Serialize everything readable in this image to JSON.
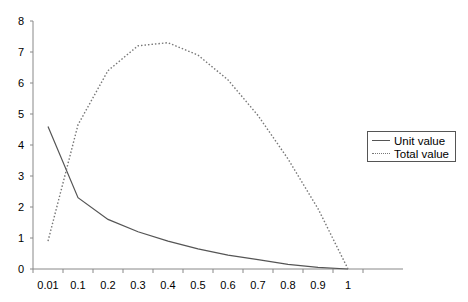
{
  "chart_data": {
    "type": "line",
    "title": "",
    "xlabel": "",
    "ylabel": "",
    "categories": [
      "0.01",
      "0.1",
      "0.2",
      "0.3",
      "0.4",
      "0.5",
      "0.6",
      "0.7",
      "0.8",
      "0.9",
      "1"
    ],
    "series": [
      {
        "name": "Unit value",
        "style": "solid",
        "color": "#555555",
        "values": [
          4.6,
          2.3,
          1.6,
          1.2,
          0.9,
          0.65,
          0.45,
          0.3,
          0.15,
          0.05,
          0.0
        ]
      },
      {
        "name": "Total value",
        "style": "dotted",
        "color": "#777777",
        "values": [
          0.9,
          4.65,
          6.4,
          7.2,
          7.3,
          6.9,
          6.1,
          4.95,
          3.55,
          1.95,
          0.0
        ]
      }
    ],
    "ylim": [
      0,
      8
    ],
    "yticks": [
      "0",
      "1",
      "2",
      "3",
      "4",
      "5",
      "6",
      "7",
      "8"
    ],
    "grid": false,
    "legend_position": "right"
  },
  "legend": {
    "items": [
      {
        "label": "Unit value"
      },
      {
        "label": "Total value"
      }
    ]
  }
}
